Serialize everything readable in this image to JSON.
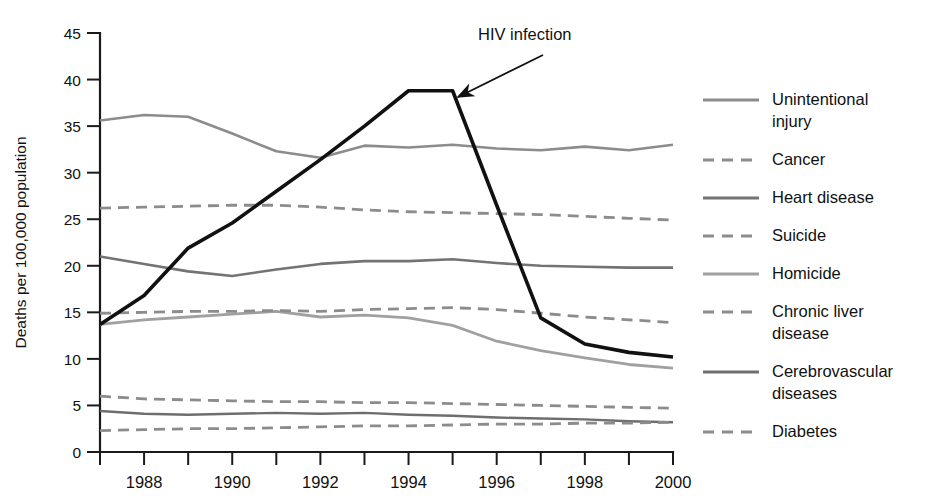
{
  "chart_data": {
    "type": "line",
    "title": "",
    "xlabel": "",
    "ylabel": "Deaths per 100,000 population",
    "xlim": [
      1987,
      2000
    ],
    "ylim": [
      0,
      45
    ],
    "ytick_step": 5,
    "yticks": [
      "0",
      "5",
      "10",
      "15",
      "20",
      "25",
      "30",
      "35",
      "40",
      "45"
    ],
    "x": [
      1987,
      1988,
      1989,
      1990,
      1991,
      1992,
      1993,
      1994,
      1995,
      1996,
      1997,
      1998,
      1999,
      2000
    ],
    "xticks_all": [
      1987,
      1988,
      1989,
      1990,
      1991,
      1992,
      1993,
      1994,
      1995,
      1996,
      1997,
      1998,
      1999,
      2000
    ],
    "xtick_labels": [
      "1988",
      "1990",
      "1992",
      "1994",
      "1996",
      "1998",
      "2000"
    ],
    "xtick_label_years": [
      1988,
      1990,
      1992,
      1994,
      1996,
      1998,
      2000
    ],
    "grid": false,
    "legend_position": "right",
    "series": [
      {
        "name": "HIV infection",
        "style": "solid",
        "color": "#111111",
        "width": 3.6,
        "labeled_on_chart": true,
        "values": [
          13.7,
          16.8,
          21.9,
          24.6,
          28.0,
          31.4,
          35.0,
          38.8,
          38.8,
          26.5,
          14.4,
          11.6,
          10.7,
          10.2
        ]
      },
      {
        "name": "Unintentional injury",
        "style": "solid",
        "color": "#8c8c8c",
        "width": 2.6,
        "values": [
          35.6,
          36.2,
          36.0,
          34.2,
          32.3,
          31.6,
          32.9,
          32.7,
          33.0,
          32.6,
          32.4,
          32.8,
          32.4,
          33.0
        ]
      },
      {
        "name": "Cancer",
        "style": "dashed",
        "color": "#8c8c8c",
        "width": 2.8,
        "values": [
          26.2,
          26.3,
          26.4,
          26.5,
          26.5,
          26.3,
          26.0,
          25.8,
          25.7,
          25.6,
          25.5,
          25.3,
          25.1,
          24.9
        ]
      },
      {
        "name": "Heart disease",
        "style": "solid",
        "color": "#737373",
        "width": 2.6,
        "values": [
          21.0,
          20.2,
          19.4,
          18.9,
          19.6,
          20.2,
          20.5,
          20.5,
          20.7,
          20.3,
          20.0,
          19.9,
          19.8,
          19.8
        ]
      },
      {
        "name": "Suicide",
        "style": "dashed",
        "color": "#8c8c8c",
        "width": 2.8,
        "values": [
          6.0,
          5.7,
          5.6,
          5.5,
          5.4,
          5.4,
          5.3,
          5.3,
          5.2,
          5.1,
          5.0,
          4.9,
          4.8,
          4.7
        ]
      },
      {
        "name": "Homicide",
        "style": "solid",
        "color": "#a0a0a0",
        "width": 2.8,
        "values": [
          13.7,
          14.2,
          14.5,
          14.8,
          15.1,
          14.5,
          14.7,
          14.4,
          13.6,
          11.9,
          10.9,
          10.1,
          9.4,
          9.0
        ]
      },
      {
        "name": "Chronic liver disease",
        "style": "dashed",
        "color": "#8c8c8c",
        "width": 2.8,
        "values": [
          14.9,
          15.0,
          15.1,
          15.1,
          15.2,
          15.1,
          15.3,
          15.4,
          15.5,
          15.3,
          14.9,
          14.5,
          14.2,
          13.9
        ]
      },
      {
        "name": "Cerebrovascular diseases",
        "style": "solid",
        "color": "#6e6e6e",
        "width": 2.4,
        "values": [
          4.4,
          4.1,
          4.0,
          4.1,
          4.2,
          4.1,
          4.2,
          4.0,
          3.9,
          3.7,
          3.6,
          3.5,
          3.3,
          3.2
        ]
      },
      {
        "name": "Diabetes",
        "style": "dashed",
        "color": "#8c8c8c",
        "width": 2.8,
        "values": [
          2.3,
          2.4,
          2.5,
          2.5,
          2.6,
          2.7,
          2.8,
          2.8,
          2.9,
          3.0,
          3.0,
          3.1,
          3.1,
          3.2
        ]
      }
    ],
    "annotations": [
      {
        "text": "HIV infection",
        "text_x": 478,
        "text_y": 40,
        "arrow_from_x": 543,
        "arrow_from_y": 55,
        "arrow_to_x": 458,
        "arrow_to_y": 97
      }
    ]
  },
  "legend": {
    "items": [
      {
        "label_line1": "Unintentional",
        "label_line2": "injury",
        "style": "solid",
        "color": "#8c8c8c"
      },
      {
        "label_line1": "Cancer",
        "label_line2": "",
        "style": "dashed",
        "color": "#8c8c8c"
      },
      {
        "label_line1": "Heart disease",
        "label_line2": "",
        "style": "solid",
        "color": "#737373"
      },
      {
        "label_line1": "Suicide",
        "label_line2": "",
        "style": "dashed",
        "color": "#8c8c8c"
      },
      {
        "label_line1": "Homicide",
        "label_line2": "",
        "style": "solid",
        "color": "#a0a0a0"
      },
      {
        "label_line1": "Chronic liver",
        "label_line2": "disease",
        "style": "dashed",
        "color": "#8c8c8c"
      },
      {
        "label_line1": "Cerebrovascular",
        "label_line2": "diseases",
        "style": "solid",
        "color": "#6e6e6e"
      },
      {
        "label_line1": "Diabetes",
        "label_line2": "",
        "style": "dashed",
        "color": "#8c8c8c"
      }
    ]
  }
}
